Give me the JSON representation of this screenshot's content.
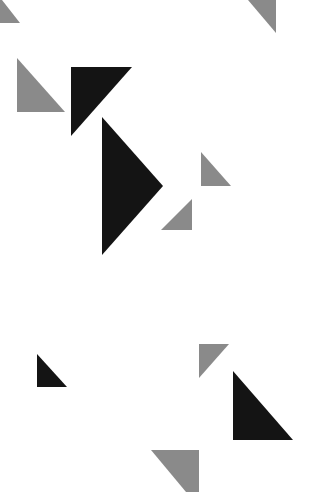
{
  "canvas": {
    "width": 328,
    "height": 492,
    "background": "#ffffff"
  },
  "colors": {
    "gray": "#8a8a8a",
    "black": "#141414"
  },
  "triangles": [
    {
      "id": "tri-top-left-gray",
      "color": "gray",
      "points": "0,0 2,0 20,23 0,23"
    },
    {
      "id": "tri-top-right-gray",
      "color": "gray",
      "points": "248,0 276,0 276,33"
    },
    {
      "id": "tri-left-gray",
      "color": "gray",
      "points": "17,58 17,112 65,112"
    },
    {
      "id": "tri-upper-black",
      "color": "black",
      "points": "71,67 132,67 71,136"
    },
    {
      "id": "tri-big-black",
      "color": "black",
      "points": "102,117 163,186 102,255"
    },
    {
      "id": "tri-mid-right-gray",
      "color": "gray",
      "points": "201,152 201,186 231,186"
    },
    {
      "id": "tri-mid-lower-gray",
      "color": "gray",
      "points": "161,230 192,199 192,230"
    },
    {
      "id": "tri-lower-left-black",
      "color": "black",
      "points": "37,354 37,387 67,387"
    },
    {
      "id": "tri-lower-gray",
      "color": "gray",
      "points": "199,344 229,344 199,378"
    },
    {
      "id": "tri-lower-right-black",
      "color": "black",
      "points": "233,371 233,440 293,440"
    },
    {
      "id": "tri-bottom-gray",
      "color": "gray",
      "points": "151,450 199,450 199,492 186,492"
    }
  ]
}
